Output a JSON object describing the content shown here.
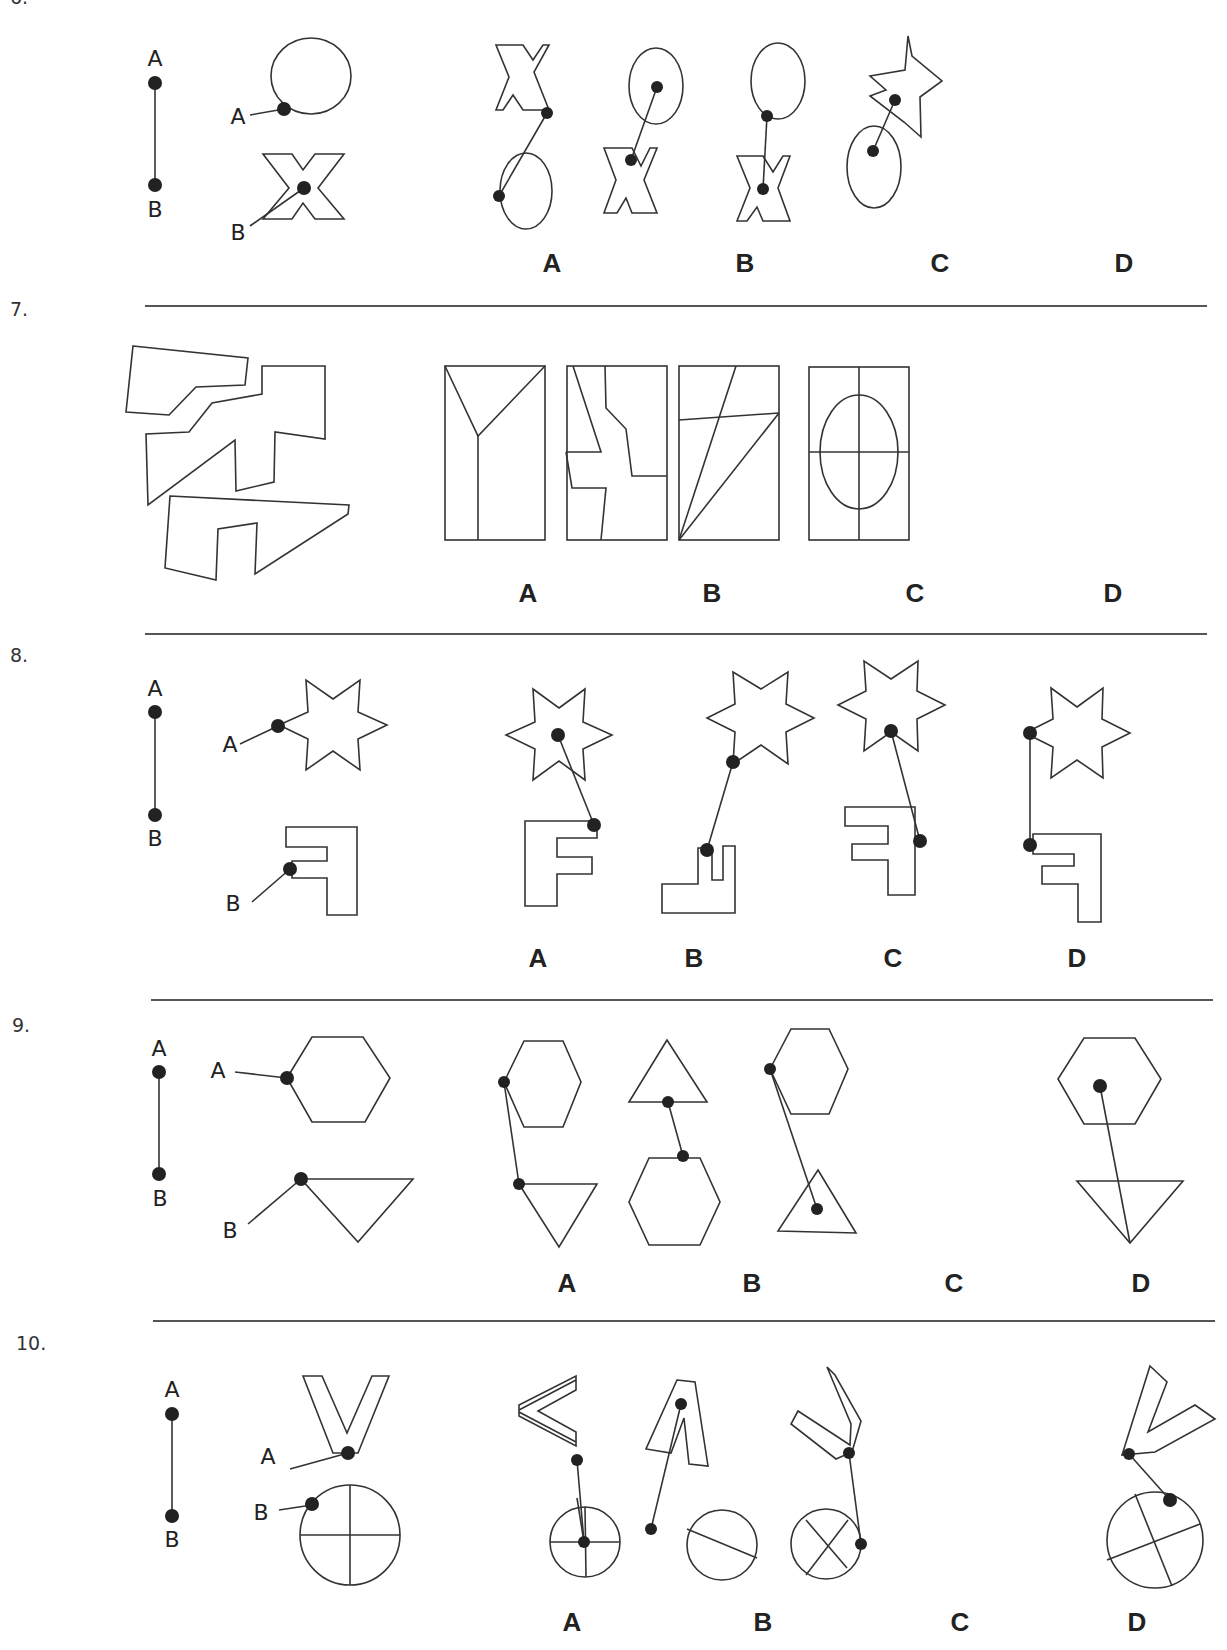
{
  "questions": [
    {
      "number": "6.",
      "reference": {
        "point_labels": [
          "A",
          "B"
        ],
        "shapes": [
          "circle",
          "x-letter"
        ],
        "attach_points": [
          "A on circle edge (lower-left)",
          "B at center of X"
        ]
      },
      "options": [
        {
          "label": "A",
          "description": "X on top, circle below; line from X right-middle to circle left edge"
        },
        {
          "label": "B",
          "description": "circle on top, X below; line from circle center to X upper-left junction"
        },
        {
          "label": "C",
          "description": "circle on top, X below; line from circle lower-left edge to X center"
        },
        {
          "label": "D",
          "description": "rotated X upper-right, circle lower-left; line from circle center to X center"
        }
      ]
    },
    {
      "number": "7.",
      "reference": {
        "shapes": [
          "three irregular polygon pieces"
        ]
      },
      "options": [
        {
          "label": "A",
          "description": "rectangle divided by a Y shape"
        },
        {
          "label": "B",
          "description": "rectangle divided by two jagged zigzag lines"
        },
        {
          "label": "C",
          "description": "rectangle divided by a slanted horizontal line and two diagonals from bottom-left"
        },
        {
          "label": "D",
          "description": "rectangle with cross and inscribed ellipse"
        }
      ]
    },
    {
      "number": "8.",
      "reference": {
        "point_labels": [
          "A",
          "B"
        ],
        "shapes": [
          "six-point star",
          "mirrored F"
        ],
        "attach_points": [
          "A at left point of star",
          "B at inner corner of F"
        ]
      },
      "options": [
        {
          "label": "A",
          "description": "star with dot at center; line to top-right corner of F"
        },
        {
          "label": "B",
          "description": "star lower-left vertex; line to rotated F shape"
        },
        {
          "label": "C",
          "description": "star center; line to right side of mirrored F"
        },
        {
          "label": "D",
          "description": "star left point; vertical line to mirrored F top-left"
        }
      ]
    },
    {
      "number": "9.",
      "reference": {
        "point_labels": [
          "A",
          "B"
        ],
        "shapes": [
          "hexagon",
          "inverted triangle"
        ],
        "attach_points": [
          "A at left vertex of hexagon",
          "B at top-left vertex of triangle"
        ]
      },
      "options": [
        {
          "label": "A",
          "description": "hexagon left vertex to inverted triangle top-left vertex"
        },
        {
          "label": "B",
          "description": "triangle base midpoint to hexagon top edge"
        },
        {
          "label": "C",
          "description": "hexagon left vertex to triangle center"
        },
        {
          "label": "D",
          "description": "hexagon center to inverted triangle bottom vertex"
        }
      ]
    },
    {
      "number": "10.",
      "reference": {
        "point_labels": [
          "A",
          "B"
        ],
        "shapes": [
          "V letter",
          "circle with cross"
        ],
        "attach_points": [
          "A at bottom of V",
          "B on circle upper-left edge"
        ]
      },
      "options": [
        {
          "label": "A",
          "description": "V rotated sideways; line from V tip to circle center"
        },
        {
          "label": "B",
          "description": "inverted V; line from apex to circle left edge with one diameter"
        },
        {
          "label": "C",
          "description": "tilted V; line to circle right edge, circle with X"
        },
        {
          "label": "D",
          "description": "tilted V; line from V bottom-left to circle top edge, rotated cross"
        }
      ]
    }
  ]
}
